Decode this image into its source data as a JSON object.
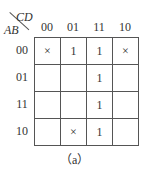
{
  "kmap": {
    "row_var": "AB",
    "col_var": "CD",
    "col_headers": [
      "00",
      "01",
      "11",
      "10"
    ],
    "row_headers": [
      "00",
      "01",
      "11",
      "10"
    ],
    "cells": [
      [
        "×",
        "1",
        "1",
        "×"
      ],
      [
        "",
        "",
        "1",
        ""
      ],
      [
        "",
        "",
        "1",
        ""
      ],
      [
        "",
        "×",
        "1",
        ""
      ]
    ]
  },
  "caption": "（a）"
}
